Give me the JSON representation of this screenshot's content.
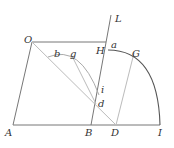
{
  "diagram": {
    "type": "geometric-construction",
    "points": {
      "O": {
        "label": "O",
        "x": 32,
        "y": 42
      },
      "A": {
        "label": "A",
        "x": 13,
        "y": 125
      },
      "B": {
        "label": "B",
        "x": 91,
        "y": 125
      },
      "D": {
        "label": "D",
        "x": 116,
        "y": 125
      },
      "I": {
        "label": "I",
        "x": 160,
        "y": 125
      },
      "H": {
        "label": "H",
        "x": 106,
        "y": 42
      },
      "L": {
        "label": "L",
        "x": 111,
        "y": 14
      },
      "a": {
        "label": "a",
        "x": 106,
        "y": 42
      },
      "G": {
        "label": "G",
        "x": 134,
        "y": 53
      },
      "b": {
        "label": "b",
        "x": 52,
        "y": 57
      },
      "g": {
        "label": "g",
        "x": 72,
        "y": 56
      },
      "i": {
        "label": "i",
        "x": 99,
        "y": 95
      },
      "d": {
        "label": "d",
        "x": 96,
        "y": 104
      }
    },
    "labels": {
      "O": "O",
      "A": "A",
      "B": "B",
      "D": "D",
      "I": "I",
      "H": "H",
      "L": "L",
      "a": "a",
      "G": "G",
      "b": "b",
      "g": "g",
      "i": "i",
      "d": "d"
    },
    "colors": {
      "line": "#777777",
      "light_line": "#bbbbbb",
      "arc": "#555555",
      "text": "#333333"
    }
  }
}
